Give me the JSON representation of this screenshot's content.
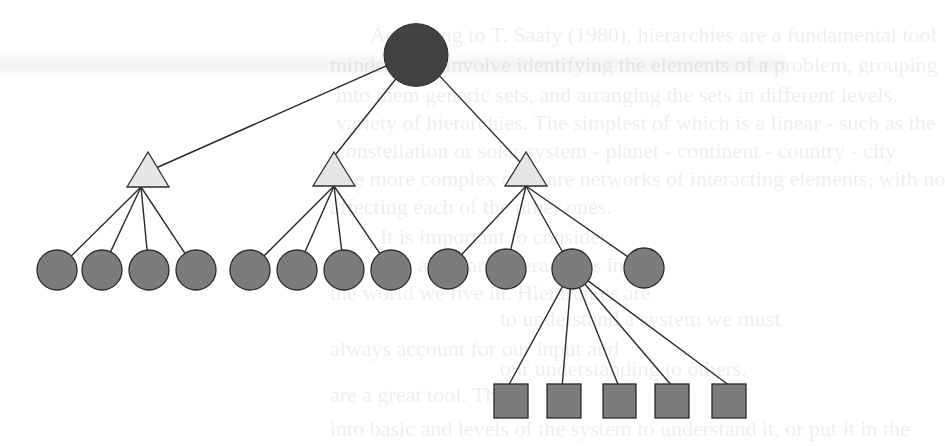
{
  "diagram": {
    "type": "hierarchy-tree",
    "colors": {
      "root_fill": "#424242",
      "intermediate_fill": "#e6e6e6",
      "leaf_fill": "#7c7c7c",
      "edge": "#2a2a2a",
      "background": "#ffffff"
    },
    "root": {
      "shape": "circle",
      "cx": 416,
      "cy": 55,
      "r": 32
    },
    "intermediates": [
      {
        "shape": "triangle",
        "apex": [
          148,
          152
        ],
        "base_y": 187,
        "half_width": 21
      },
      {
        "shape": "triangle",
        "apex": [
          334,
          152
        ],
        "base_y": 186,
        "half_width": 21
      },
      {
        "shape": "triangle",
        "apex": [
          526,
          152
        ],
        "base_y": 186,
        "half_width": 21
      }
    ],
    "groups": [
      {
        "parent": 0,
        "children": [
          {
            "cx": 57,
            "cy": 270
          },
          {
            "cx": 102,
            "cy": 270
          },
          {
            "cx": 149,
            "cy": 270
          },
          {
            "cx": 196,
            "cy": 270
          }
        ]
      },
      {
        "parent": 1,
        "children": [
          {
            "cx": 250,
            "cy": 270
          },
          {
            "cx": 297,
            "cy": 270
          },
          {
            "cx": 344,
            "cy": 270
          },
          {
            "cx": 391,
            "cy": 270
          }
        ]
      },
      {
        "parent": 2,
        "children": [
          {
            "cx": 448,
            "cy": 269
          },
          {
            "cx": 506,
            "cy": 269
          },
          {
            "cx": 572,
            "cy": 269
          },
          {
            "cx": 644,
            "cy": 268
          }
        ]
      }
    ],
    "leaf_radius": 20,
    "sub_leaves": {
      "parent": {
        "group": 2,
        "index": 2
      },
      "squares": [
        {
          "x": 494,
          "y": 384,
          "w": 34,
          "h": 34
        },
        {
          "x": 547,
          "y": 384,
          "w": 34,
          "h": 34
        },
        {
          "x": 603,
          "y": 384,
          "w": 33,
          "h": 34
        },
        {
          "x": 655,
          "y": 384,
          "w": 34,
          "h": 34
        },
        {
          "x": 712,
          "y": 384,
          "w": 34,
          "h": 34
        }
      ]
    }
  },
  "background_bleed_text": [
    {
      "text": "According to T. Saaty (1980), hierarchies are a fundamental tool",
      "x": 370,
      "y": 20
    },
    {
      "text": "minds. They involve identifying the elements of a problem, grouping",
      "x": 330,
      "y": 50
    },
    {
      "text": "into them generic sets, and arranging the sets in different levels.",
      "x": 336,
      "y": 80
    },
    {
      "text": "variety of hierarchies. The simplest of which is a linear - such as the",
      "x": 336,
      "y": 108
    },
    {
      "text": "constellation or solar system - planet - continent - country - city",
      "x": 336,
      "y": 136
    },
    {
      "text": "The more complex ones are networks of interacting elements, with no",
      "x": 330,
      "y": 164
    },
    {
      "text": "affecting each of the other ones.",
      "x": 330,
      "y": 192
    },
    {
      "text": "It is important to consider",
      "x": 380,
      "y": 222
    },
    {
      "text": "that there are many hierarchies in",
      "x": 330,
      "y": 250
    },
    {
      "text": "the world we live in. Hierarchies are",
      "x": 330,
      "y": 278
    },
    {
      "text": "to understand a system we must",
      "x": 500,
      "y": 304
    },
    {
      "text": "always account for our input and",
      "x": 330,
      "y": 334
    },
    {
      "text": "our understanding to others.",
      "x": 500,
      "y": 354
    },
    {
      "text": "are a great tool. The",
      "x": 330,
      "y": 380
    },
    {
      "text": "into basic and levels of the system to understand it, or put it in the",
      "x": 330,
      "y": 414
    }
  ]
}
